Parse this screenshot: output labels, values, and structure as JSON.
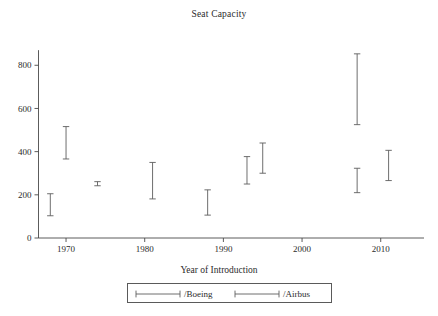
{
  "chart_data": {
    "type": "bar",
    "subtype": "range-spike",
    "title": "Seat Capacity",
    "xlabel": "Year of Introduction",
    "ylabel": "",
    "xlim": [
      1966.5,
      2015.5
    ],
    "ylim": [
      0,
      880
    ],
    "grid": false,
    "xticks": [
      1970,
      1980,
      1990,
      2000,
      2010
    ],
    "xticklabels": [
      "1970",
      "1980",
      "1990",
      "2000",
      "2010"
    ],
    "yticks": [
      0,
      200,
      400,
      600,
      800
    ],
    "yticklabels": [
      "0",
      "200",
      "400",
      "600",
      "800"
    ],
    "legend_position": "bottom",
    "series": [
      {
        "name": "/Boeing",
        "points": [
          {
            "x": 1968,
            "low": 103,
            "high": 205
          },
          {
            "x": 1970,
            "low": 366,
            "high": 516
          },
          {
            "x": 1981,
            "low": 181,
            "high": 350
          },
          {
            "x": 1988,
            "low": 106,
            "high": 223
          },
          {
            "x": 2007,
            "low": 210,
            "high": 323
          },
          {
            "x": 2011,
            "low": 266,
            "high": 406
          }
        ]
      },
      {
        "name": "/Airbus",
        "points": [
          {
            "x": 1974,
            "low": 242,
            "high": 261
          },
          {
            "x": 1993,
            "low": 250,
            "high": 377
          },
          {
            "x": 1995,
            "low": 300,
            "high": 440
          },
          {
            "x": 2007,
            "low": 525,
            "high": 853
          }
        ]
      }
    ]
  },
  "legend": {
    "entries": [
      {
        "label": "/Boeing"
      },
      {
        "label": "/Airbus"
      }
    ]
  }
}
